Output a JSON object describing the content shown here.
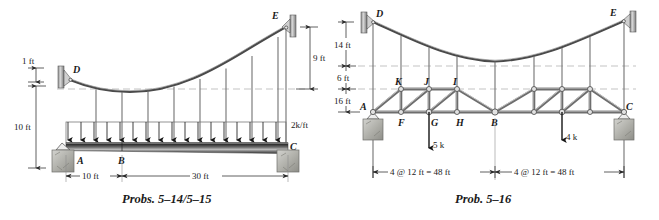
{
  "sheet": {
    "background_color": "#ffffff",
    "ink_color": "#1a1a1a"
  },
  "figures": [
    {
      "id": "probs-5-14-5-15",
      "caption": "Probs. 5–14/5–15",
      "description": "Suspension cable DE with vertical hangers supporting a beam ABC under a uniform distributed load",
      "labels": {
        "anchor_left": "D",
        "anchor_right": "E",
        "support_left": "A",
        "interior_point": "B",
        "support_right": "C"
      },
      "dimensions": {
        "sag_offset": "1 ft",
        "hanger_drop_left": "10 ft",
        "rise_right": "9 ft",
        "span_left": "10 ft",
        "span_right": "30 ft"
      },
      "loads": {
        "distributed": "2k/ft"
      },
      "counts": {
        "hangers": 9,
        "load_arrows": 17
      }
    },
    {
      "id": "prob-5-16",
      "caption": "Prob. 5–16",
      "description": "Suspension cable DE with hangers supporting a trussed deck AC carrying two concentrated loads",
      "labels": {
        "anchor_left": "D",
        "anchor_right": "E",
        "support_left": "A",
        "support_right": "C",
        "joint_mid_bottom": "B",
        "top_chord": [
          "K",
          "J",
          "I"
        ],
        "bottom_chord": [
          "F",
          "G",
          "H"
        ]
      },
      "dimensions": {
        "cable_to_top_chord": "14 ft",
        "top_chord_depth": "6 ft",
        "truss_depth": "16 ft",
        "span_left": "4 @ 12 ft = 48 ft",
        "span_right": "4 @ 12 ft = 48 ft"
      },
      "loads": {
        "point_load_g": "5 k",
        "point_load_right": "4 k"
      },
      "counts": {
        "hangers": 6,
        "panels_each_side": 4
      }
    }
  ]
}
